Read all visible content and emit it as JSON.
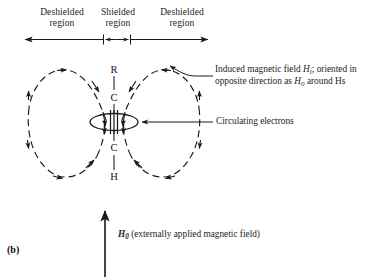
{
  "figure": {
    "label": "(b)"
  },
  "regions": {
    "items": [
      {
        "line1": "Deshielded",
        "line2": "region"
      },
      {
        "line1": "Shielded",
        "line2": "region"
      },
      {
        "line1": "Deshielded",
        "line2": "region"
      }
    ]
  },
  "molecule": {
    "name": "alkyne-chain",
    "atoms": [
      "R",
      "C",
      "C",
      "H"
    ],
    "bond_type": "triple"
  },
  "annotations": {
    "induced_field": {
      "line1_before": "Induced magnetic field ",
      "line1_symbol": "H",
      "line1_sub": "i",
      "line1_after": "; oriented in",
      "line2_before": "opposite direction as ",
      "line2_symbol": "H",
      "line2_sub": "o",
      "line2_after": " around Hs"
    },
    "circulating_electrons": {
      "text": "Circulating electrons"
    },
    "applied_field": {
      "symbol": "H",
      "sub": "0",
      "text": " (externally applied magnetic field)"
    }
  },
  "colors": {
    "ink": "#1a1a1a",
    "background": "#ffffff"
  }
}
